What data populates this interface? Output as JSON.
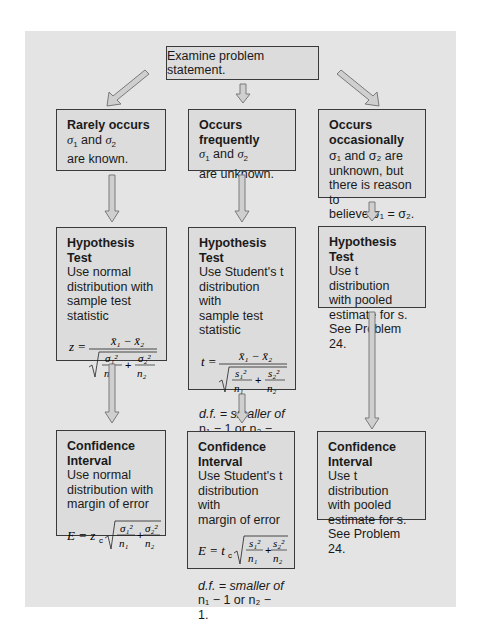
{
  "top": {
    "label": "Examine problem statement."
  },
  "columns": [
    {
      "case": {
        "title": "Rarely occurs",
        "line1_a": "σ",
        "line1_b": "1",
        "line1_c": " and ",
        "line1_d": "σ",
        "line1_e": "2",
        "line2": "are known."
      },
      "hypothesis": {
        "title": "Hypothesis Test",
        "lines": [
          "Use normal",
          "distribution with",
          "sample test statistic"
        ],
        "formula": "z = (x̄₁ − x̄₂) / √(σ₁²/n₁ + σ₂²/n₂)",
        "lhs": "z ="
      },
      "confidence": {
        "title": "Confidence Interval",
        "lines": [
          "Use normal",
          "distribution with",
          "margin of error"
        ],
        "formula": "E = z_c √(σ₁²/n₁ + σ₂²/n₂)",
        "lhs": "E = z",
        "lhs_sub": "c"
      }
    },
    {
      "case": {
        "title": "Occurs frequently",
        "line1_a": "σ",
        "line1_b": "1",
        "line1_c": " and ",
        "line1_d": "σ",
        "line1_e": "2",
        "line2": "are unknown."
      },
      "hypothesis": {
        "title": "Hypothesis Test",
        "lines": [
          "Use Student's t",
          "distribution with",
          "sample test statistic"
        ],
        "formula": "t = (x̄₁ − x̄₂) / √(s₁²/n₁ + s₂²/n₂)",
        "lhs": "t =",
        "df_line1": "d.f. = smaller of",
        "df_line2": "n₁ − 1 or n₂ − 1."
      },
      "confidence": {
        "title": "Confidence Interval",
        "lines": [
          "Use Student's t",
          "distribution with",
          "margin of error"
        ],
        "formula": "E = t_c √(s₁²/n₁ + s₂²/n₂)",
        "lhs": "E = t",
        "lhs_sub": "c",
        "df_line1": "d.f. = smaller of",
        "df_line2": "n₁ − 1 or n₂ − 1."
      }
    },
    {
      "case": {
        "title": "Occurs occasionally",
        "lines": [
          "σ₁ and σ₂ are",
          "unknown, but",
          "there is reason to",
          "believe σ₁ = σ₂."
        ]
      },
      "hypothesis": {
        "title": "Hypothesis Test",
        "lines": [
          "Use t distribution",
          "with pooled",
          "estimate for s.",
          "See Problem 24."
        ]
      },
      "confidence": {
        "title": "Confidence Interval",
        "lines": [
          "Use t distribution",
          "with pooled",
          "estimate for s.",
          "See Problem 24."
        ]
      }
    }
  ],
  "colors": {
    "panel": "#e4e4e4",
    "box": "#dcdcdc",
    "border": "#3a3a3a",
    "arrow_fill": "#c8c8c8",
    "arrow_stroke": "#7a7a7a"
  }
}
